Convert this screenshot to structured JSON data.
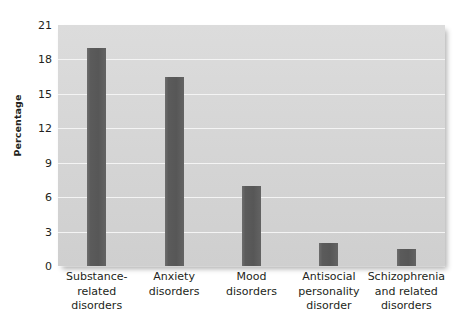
{
  "chart_data": {
    "type": "bar",
    "title": "",
    "subtitle": "",
    "xlabel": "",
    "ylabel": "Percentage",
    "ylim": [
      0,
      21
    ],
    "yticks": [
      0,
      3,
      6,
      9,
      12,
      15,
      18,
      21
    ],
    "ytick_labels": [
      "0",
      "3",
      "6",
      "9",
      "12",
      "15",
      "18",
      "21"
    ],
    "grid": true,
    "legend": false,
    "legend_position": "none",
    "categories": [
      "Substance-\nrelated\ndisorders",
      "Anxiety\ndisorders",
      "Mood\ndisorders",
      "Antisocial\npersonality\ndisorder",
      "Schizophrenia\nand related\ndisorders"
    ],
    "category_lines": [
      [
        "Substance-",
        "related",
        "disorders"
      ],
      [
        "Anxiety",
        "disorders"
      ],
      [
        "Mood",
        "disorders"
      ],
      [
        "Antisocial",
        "personality",
        "disorder"
      ],
      [
        "Schizophrenia",
        "and related",
        "disorders"
      ]
    ],
    "values": [
      19,
      16.5,
      7,
      2,
      1.5
    ],
    "colors": {
      "bar": "#575757",
      "plot_background": "#d6d6d6",
      "gridline": "#f4f4f4",
      "text": "#231f20",
      "page_background": "#ffffff"
    }
  },
  "axis": {
    "y_title": "Percentage"
  }
}
